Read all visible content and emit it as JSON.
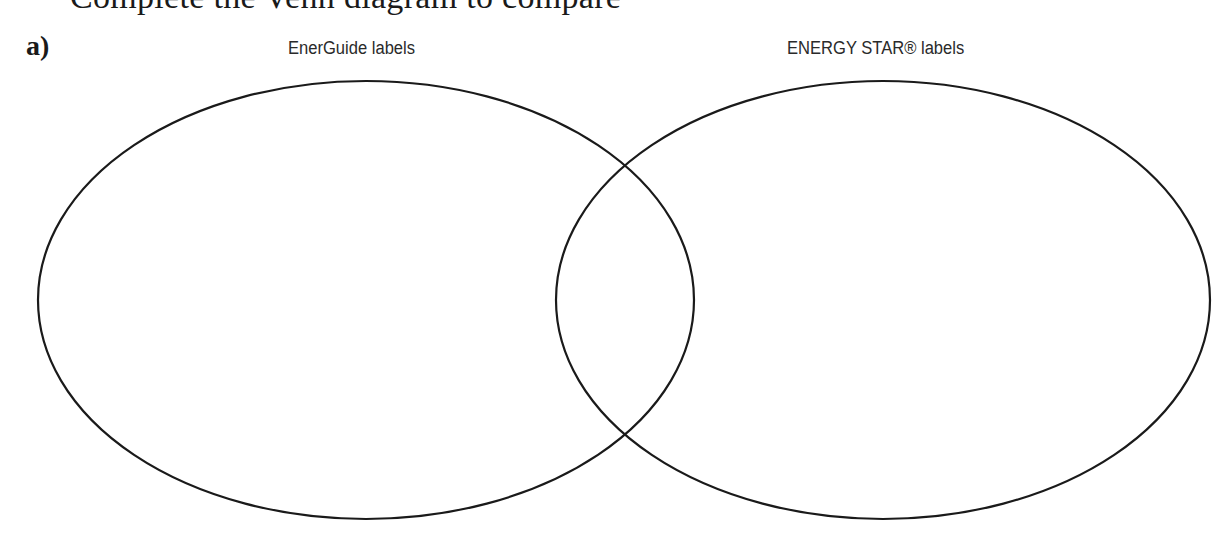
{
  "question": {
    "cropped_heading": "Complete the Venn diagram to compare",
    "part_label": "a)"
  },
  "venn": {
    "sets": [
      {
        "label": "EnerGuide labels",
        "cx": 366,
        "cy": 300,
        "rx": 328,
        "ry": 219
      },
      {
        "label": "ENERGY STAR® labels",
        "cx": 883,
        "cy": 300,
        "rx": 327,
        "ry": 219
      }
    ],
    "stroke_color": "#1a1a1a"
  }
}
